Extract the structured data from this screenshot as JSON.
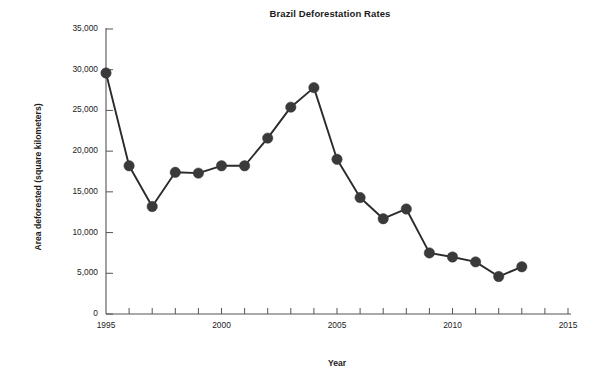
{
  "chart_data": {
    "type": "line",
    "title": "Brazil Deforestation Rates",
    "xlabel": "Year",
    "ylabel": "Area deforested (square kilometers)",
    "x": [
      1995,
      1996,
      1997,
      1998,
      1999,
      2000,
      2001,
      2002,
      2003,
      2004,
      2005,
      2006,
      2007,
      2008,
      2009,
      2010,
      2011,
      2012,
      2013
    ],
    "values": [
      29600,
      18200,
      13200,
      17400,
      17300,
      18200,
      18200,
      21600,
      25400,
      27800,
      19000,
      14300,
      11700,
      12900,
      7500,
      7000,
      6400,
      4600,
      5800
    ],
    "series": [
      {
        "name": "Area deforested",
        "values": [
          29600,
          18200,
          13200,
          17400,
          17300,
          18200,
          18200,
          21600,
          25400,
          27800,
          19000,
          14300,
          11700,
          12900,
          7500,
          7000,
          6400,
          4600,
          5800
        ]
      }
    ],
    "xlim": [
      1995,
      2015
    ],
    "ylim": [
      0,
      35000
    ],
    "ytick_values": [
      0,
      5000,
      10000,
      15000,
      20000,
      25000,
      30000,
      35000
    ],
    "ytick_labels": [
      "0",
      "5,000",
      "10,000",
      "15,000",
      "20,000",
      "25,000",
      "30,000",
      "35,000"
    ],
    "xtick_values": [
      1995,
      2000,
      2005,
      2010,
      2015
    ],
    "xtick_labels": [
      "1995",
      "2000",
      "2005",
      "2010",
      "2015"
    ],
    "x_minor_tick_step": 1,
    "grid": false,
    "legend": "none",
    "marker": "circle",
    "line_color": "#2b2b2b",
    "marker_color": "#3a3a3a",
    "axis_color": "#555555",
    "background": "#ffffff"
  }
}
